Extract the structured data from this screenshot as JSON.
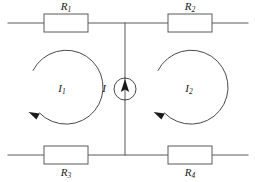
{
  "figure": {
    "type": "circuit-diagram",
    "background_color": "#ffffff",
    "line_color": "#5a5a5a",
    "label_color": "#1a1a1a"
  },
  "components": {
    "resistors": [
      {
        "id": "R1",
        "label": "R",
        "subscript": "1",
        "position": "top-left",
        "label_placement": "above",
        "x": 66,
        "y": 23
      },
      {
        "id": "R2",
        "label": "R",
        "subscript": "2",
        "position": "top-right",
        "label_placement": "above",
        "x": 190,
        "y": 23
      },
      {
        "id": "R3",
        "label": "R",
        "subscript": "3",
        "position": "bottom-left",
        "label_placement": "below",
        "x": 66,
        "y": 155
      },
      {
        "id": "R4",
        "label": "R",
        "subscript": "4",
        "position": "bottom-right",
        "label_placement": "below",
        "x": 190,
        "y": 155
      }
    ],
    "current_source": {
      "id": "I",
      "label": "I",
      "subscript": "",
      "symbol": "circle-with-up-arrow",
      "direction": "up",
      "center_x": 125,
      "center_y": 89,
      "radius": 11,
      "label_x": 104,
      "label_y": 89
    },
    "mesh_loops": [
      {
        "id": "I1",
        "label": "I",
        "subscript": "1",
        "direction": "counterclockwise",
        "center_x": 65,
        "center_y": 89,
        "radius": 37,
        "label_x": 62,
        "label_y": 89
      },
      {
        "id": "I2",
        "label": "I",
        "subscript": "2",
        "direction": "counterclockwise",
        "center_x": 190,
        "center_y": 89,
        "radius": 37,
        "label_x": 189,
        "label_y": 89
      }
    ]
  },
  "wires": {
    "top_rail_y": 23,
    "bottom_rail_y": 155,
    "center_branch_x": 125,
    "left_edge_x": 8,
    "right_edge_x": 248
  }
}
